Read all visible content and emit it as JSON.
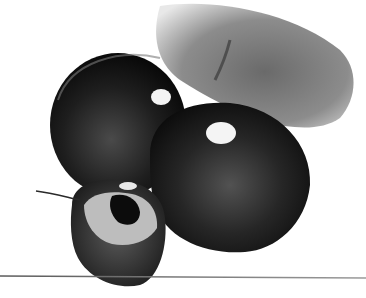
{
  "image": {
    "subject": "Pencil illustration of dark cherries",
    "width": 366,
    "height": 298,
    "background": "#ffffff",
    "elements": [
      {
        "name": "leaf",
        "description": "Gray shaded leaf behind cherries at upper right"
      },
      {
        "name": "cherry-left",
        "description": "Large dark glossy cherry with white highlight"
      },
      {
        "name": "cherry-right",
        "description": "Large dark glossy cherry with white highlight, front"
      },
      {
        "name": "cherry-cut",
        "description": "Bitten/cut cherry showing lighter flesh and pit, lower left"
      },
      {
        "name": "stem",
        "description": "Thin stem extending left from cut cherry"
      },
      {
        "name": "ground-line",
        "description": "Thin horizontal line near bottom"
      }
    ],
    "colors": {
      "cherry_dark": "#0c0c0c",
      "cherry_mid": "#3a3a3a",
      "leaf": "#8a8a8a",
      "highlight": "#f4f4f4",
      "flesh": "#bdbdbd",
      "line": "#6e6e6e"
    }
  }
}
